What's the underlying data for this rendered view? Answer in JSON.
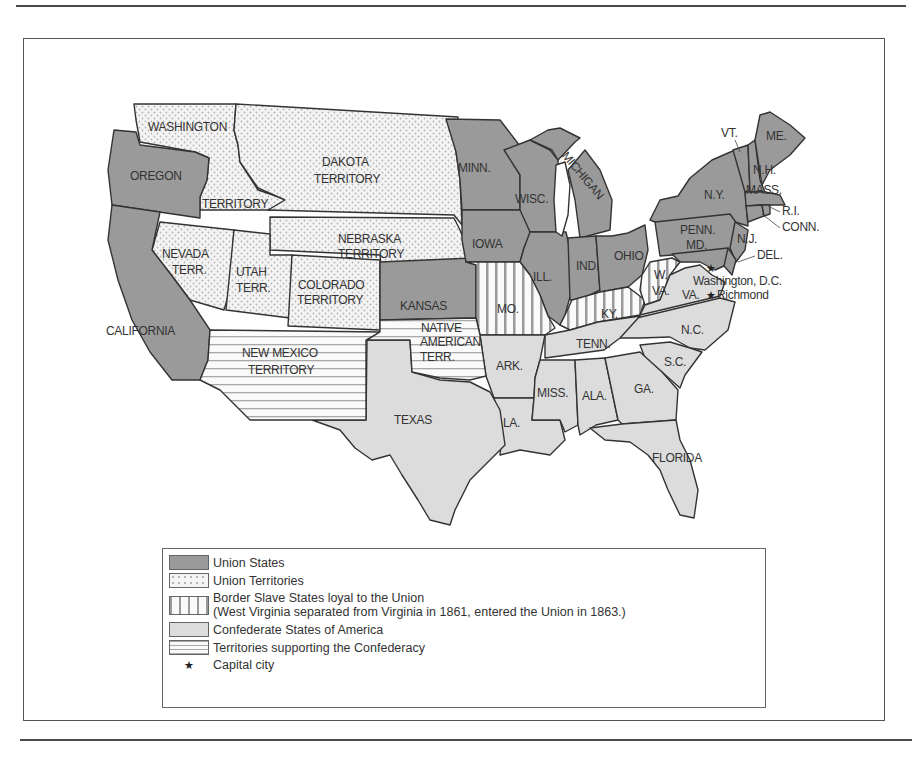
{
  "map": {
    "title": "Union and Confederacy, 1861-1865",
    "colors": {
      "union_state": "#9a9a9a",
      "union_territory_bg": "#f4f4f4",
      "union_territory_dot": "#b5b5b5",
      "border_state_stripe": "#9a9a9a",
      "confederate_state": "#dcdcdc",
      "confed_territory_stripe": "#a8a8a8",
      "border_line": "#333333"
    },
    "labels": {
      "washington": "WASHINGTON",
      "washington_terr": "TERRITORY",
      "oregon": "OREGON",
      "dakota_1": "DAKOTA",
      "dakota_2": "TERRITORY",
      "minn": "MINN.",
      "wisc": "WISC.",
      "michigan": "MICHIGAN",
      "iowa": "IOWA",
      "nebraska_1": "NEBRASKA",
      "nebraska_2": "TERRITORY",
      "nevada_1": "NEVADA",
      "nevada_2": "TERR.",
      "utah_1": "UTAH",
      "utah_2": "TERR.",
      "colorado_1": "COLORADO",
      "colorado_2": "TERRITORY",
      "kansas": "KANSAS",
      "california": "CALIFORNIA",
      "new_mexico_1": "NEW MEXICO",
      "new_mexico_2": "TERRITORY",
      "native_1": "NATIVE",
      "native_2": "AMERICAN",
      "native_3": "TERR.",
      "texas": "TEXAS",
      "mo": "MO.",
      "ill": "ILL.",
      "ind": "IND.",
      "ohio": "OHIO",
      "ky": "KY.",
      "wva_1": "W.",
      "wva_2": "VA.",
      "va": "VA.",
      "ark": "ARK.",
      "tenn": "TENN.",
      "nc": "N.C.",
      "sc": "S.C.",
      "miss": "MISS.",
      "ala": "ALA.",
      "ga": "GA.",
      "la": "LA.",
      "florida": "FLORIDA",
      "ny": "N.Y.",
      "penn": "PENN.",
      "md": "MD.",
      "nj": "N.J.",
      "del": "DEL.",
      "vt": "VT.",
      "me": "ME.",
      "nh": "N.H.",
      "mass": "MASS.",
      "ri": "R.I.",
      "conn": "CONN.",
      "washington_dc": "Washington, D.C.",
      "richmond": "Richmond"
    }
  },
  "legend": {
    "items": [
      {
        "key": "union_states",
        "label": "Union States"
      },
      {
        "key": "union_territories",
        "label": "Union Territories"
      },
      {
        "key": "border_slave_states",
        "label": "Border Slave States loyal to the Union",
        "note": "(West Virginia separated from Virginia in 1861, entered the Union in 1863.)"
      },
      {
        "key": "confederate_states",
        "label": "Confederate States of America"
      },
      {
        "key": "confederate_territories",
        "label": "Territories supporting the Confederacy"
      },
      {
        "key": "capital_city",
        "label": "Capital city",
        "symbol": "★"
      }
    ]
  }
}
